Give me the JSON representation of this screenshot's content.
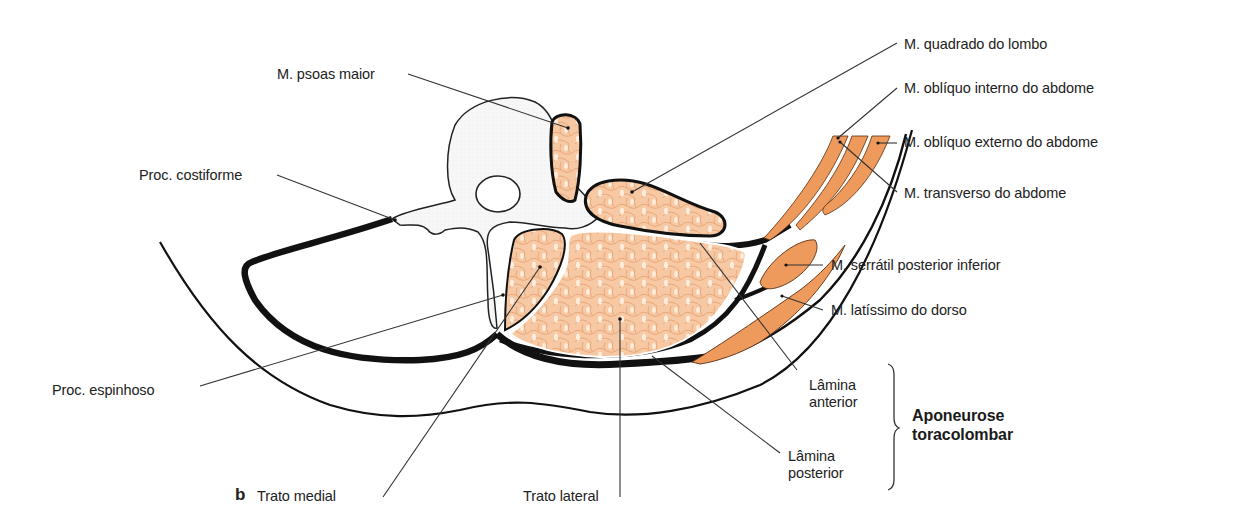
{
  "figure": {
    "panel_letter": "b",
    "colors": {
      "background": "#ffffff",
      "outline": "#111111",
      "deep_muscle_fill": "#f6c9a4",
      "deep_muscle_texture": "#e9a778",
      "flat_muscle_fill": "#ee9a5c",
      "bone_fill": "#f4f4f4",
      "label_text": "#222222",
      "leader_line": "#333333"
    }
  },
  "labels": {
    "psoas": "M. psoas maior",
    "costiforme": "Proc. costiforme",
    "espinhoso": "Proc. espinhoso",
    "trato_medial": "Trato medial",
    "trato_lateral": "Trato lateral",
    "quadrado": "M. quadrado do lombo",
    "obliquo_interno": "M. oblíquo interno do abdome",
    "obliquo_externo": "M. oblíquo externo do abdome",
    "transverso": "M. transverso do abdome",
    "serratil": "M. serrátil posterior inferior",
    "latissimo": "M. latíssimo do dorso",
    "lamina_anterior": [
      "Lâmina",
      "anterior"
    ],
    "lamina_posterior": [
      "Lâmina",
      "posterior"
    ],
    "aponeurose": [
      "Aponeurose",
      "toracolombar"
    ]
  }
}
